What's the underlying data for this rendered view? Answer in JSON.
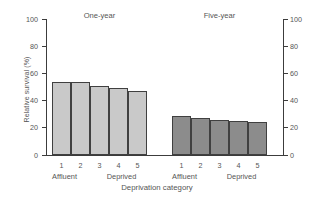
{
  "chart_data": {
    "type": "bar",
    "title": "",
    "xlabel": "Deprivation category",
    "ylabel": "Relative survival (%)",
    "ylim": [
      0,
      100
    ],
    "yticks": [
      0,
      20,
      40,
      60,
      80,
      100
    ],
    "ytick_labels": [
      "0",
      "20",
      "40",
      "60",
      "80",
      "100"
    ],
    "right_axis": {
      "present": true,
      "ylim": [
        0,
        100
      ],
      "yticks": [
        0,
        20,
        40,
        60,
        80,
        100
      ],
      "ytick_labels": [
        "0",
        "20",
        "40",
        "60",
        "80",
        "100"
      ]
    },
    "grid": false,
    "legend": "none",
    "categories": [
      "1",
      "2",
      "3",
      "4",
      "5"
    ],
    "category_end_labels": [
      "Affluent",
      "Deprived"
    ],
    "groups": [
      {
        "name": "One-year",
        "color": "#c9c9c9",
        "values": [
          54,
          53.5,
          50.5,
          49.5,
          47
        ]
      },
      {
        "name": "Five-year",
        "color": "#8c8c8c",
        "values": [
          28.5,
          27.5,
          26,
          25,
          24.5
        ]
      }
    ]
  },
  "figure": {
    "background": "#ffffff",
    "axis_color": "#3c3c3c",
    "text_color": "#555555",
    "bar_edge_color": "#404040"
  }
}
